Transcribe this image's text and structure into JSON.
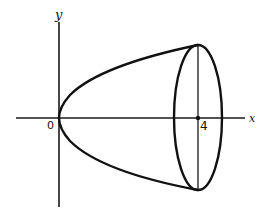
{
  "diagram": {
    "axes": {
      "x_label": "x",
      "y_label": "y",
      "origin_label": "0"
    },
    "tick_labels": [
      {
        "value": 4,
        "text": "4"
      }
    ],
    "shapes": [
      {
        "type": "parabola",
        "equation": "x = y^2 (both branches)",
        "from": 0,
        "to": 4
      },
      {
        "type": "ellipse",
        "center_x": 4,
        "description": "circular cross-section drawn in perspective at x = 4"
      },
      {
        "type": "vertical-line",
        "at_x": 4,
        "description": "diameter of the end disc"
      }
    ],
    "colors": {
      "ink": "#111111",
      "background": "#ffffff"
    }
  }
}
